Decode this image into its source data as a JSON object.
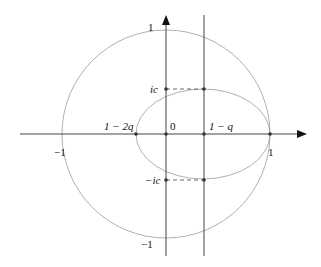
{
  "figure": {
    "labels": {
      "y_top": "1",
      "y_bottom": "−1",
      "x_left": "−1",
      "x_right": "1",
      "origin": "0",
      "one_minus_2q": "1 − 2q",
      "one_minus_q": "1 − q",
      "ic": "ic",
      "minus_ic": "−ic"
    },
    "colors": {
      "axis": "#222222",
      "curve": "#999999"
    }
  }
}
